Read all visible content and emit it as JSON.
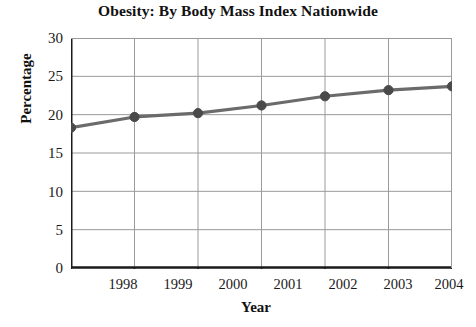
{
  "chart_data": {
    "type": "line",
    "title": "Obesity: By Body Mass Index Nationwide",
    "xlabel": "Year",
    "ylabel": "Percentage",
    "categories": [
      "1998",
      "1999",
      "2000",
      "2001",
      "2002",
      "2003",
      "2004"
    ],
    "x": [
      1998,
      1999,
      2000,
      2001,
      2002,
      2003,
      2004
    ],
    "values": [
      18.3,
      19.7,
      20.2,
      21.2,
      22.4,
      23.2,
      23.7
    ],
    "series": [
      {
        "name": "Obesity percentage",
        "values": [
          18.3,
          19.7,
          20.2,
          21.2,
          22.4,
          23.2,
          23.7
        ]
      }
    ],
    "ylim": [
      0,
      30
    ],
    "ytick_labels": [
      "30",
      "25",
      "20",
      "15",
      "10",
      "5",
      "0"
    ],
    "yticks": [
      30,
      25,
      20,
      15,
      10,
      5,
      0
    ],
    "xtick_labels": [
      "1998",
      "1999",
      "2000",
      "2001",
      "2002",
      "2003",
      "2004"
    ],
    "grid": true,
    "grid_axes": "both",
    "legend": false,
    "legend_position": "none",
    "marker": "circle",
    "colors": {
      "line": "#6b6b6b",
      "marker": "#4a4a4a",
      "grid": "#9a9a9a",
      "axis": "#1a1a1a",
      "background": "#ffffff",
      "text": "#111111"
    }
  }
}
